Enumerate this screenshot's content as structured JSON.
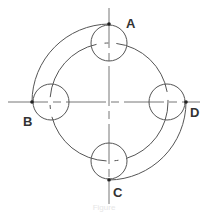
{
  "diagram": {
    "labels": {
      "a": "A",
      "b": "B",
      "c": "C",
      "d": "D"
    },
    "colors": {
      "stroke": "#555555",
      "centerline": "#777777",
      "point": "#222222",
      "background": "#ffffff"
    },
    "elements": {
      "small_circles": [
        "A",
        "B",
        "C",
        "D"
      ],
      "main_dashed_circle": "pitch circle through small-circle centers",
      "outer_arcs": [
        "A to B",
        "D to C"
      ]
    },
    "caption": "Figure"
  }
}
